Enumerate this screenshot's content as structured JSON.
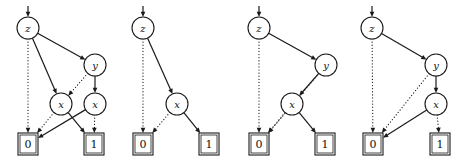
{
  "figure": {
    "kind": "bdd-diagram-row",
    "count": 4,
    "width": 467,
    "height": 164,
    "colors": {
      "background": "#ffffff",
      "stroke": "#1a1a1a",
      "label": "#111111"
    }
  },
  "labels": {
    "z": "z",
    "y": "y",
    "x": "x",
    "zero": "0",
    "one": "1"
  },
  "diagrams": [
    {
      "name": "diagram-1",
      "nodes": [
        {
          "id": "d1-z",
          "label": "z",
          "cx": 28,
          "cy": 28,
          "r": 11
        },
        {
          "id": "d1-y",
          "label": "y",
          "cx": 95,
          "cy": 65,
          "r": 11
        },
        {
          "id": "d1-x1",
          "label": "x",
          "cx": 61,
          "cy": 104,
          "r": 11
        },
        {
          "id": "d1-x2",
          "label": "x",
          "cx": 95,
          "cy": 104,
          "r": 11
        }
      ],
      "terminals": [
        {
          "id": "d1-t0",
          "label": "0",
          "cx": 28,
          "cy": 144,
          "w": 20,
          "h": 22
        },
        {
          "id": "d1-t1",
          "label": "1",
          "cx": 94,
          "cy": 144,
          "w": 20,
          "h": 22
        }
      ],
      "root_arrow": {
        "to": "d1-z"
      },
      "edges": [
        {
          "from": "d1-z",
          "to": "d1-t0",
          "style": "dotted"
        },
        {
          "from": "d1-z",
          "to": "d1-x1",
          "style": "solid"
        },
        {
          "from": "d1-z",
          "to": "d1-y",
          "style": "solid"
        },
        {
          "from": "d1-y",
          "to": "d1-x1",
          "style": "dotted"
        },
        {
          "from": "d1-y",
          "to": "d1-x2",
          "style": "solid"
        },
        {
          "from": "d1-x1",
          "to": "d1-t0",
          "style": "dotted"
        },
        {
          "from": "d1-x1",
          "to": "d1-t1",
          "style": "solid"
        },
        {
          "from": "d1-x2",
          "to": "d1-t0",
          "style": "solid"
        },
        {
          "from": "d1-x2",
          "to": "d1-t1",
          "style": "dotted"
        }
      ]
    },
    {
      "name": "diagram-2",
      "nodes": [
        {
          "id": "d2-z",
          "label": "z",
          "cx": 143,
          "cy": 28,
          "r": 11
        },
        {
          "id": "d2-x",
          "label": "x",
          "cx": 177,
          "cy": 104,
          "r": 11
        }
      ],
      "terminals": [
        {
          "id": "d2-t0",
          "label": "0",
          "cx": 143,
          "cy": 144,
          "w": 20,
          "h": 22
        },
        {
          "id": "d2-t1",
          "label": "1",
          "cx": 209,
          "cy": 144,
          "w": 20,
          "h": 22
        }
      ],
      "root_arrow": {
        "to": "d2-z"
      },
      "edges": [
        {
          "from": "d2-z",
          "to": "d2-t0",
          "style": "dotted"
        },
        {
          "from": "d2-z",
          "to": "d2-x",
          "style": "solid"
        },
        {
          "from": "d2-x",
          "to": "d2-t0",
          "style": "dotted"
        },
        {
          "from": "d2-x",
          "to": "d2-t1",
          "style": "solid"
        }
      ]
    },
    {
      "name": "diagram-3",
      "nodes": [
        {
          "id": "d3-z",
          "label": "z",
          "cx": 259,
          "cy": 28,
          "r": 11
        },
        {
          "id": "d3-y",
          "label": "y",
          "cx": 326,
          "cy": 65,
          "r": 11
        },
        {
          "id": "d3-x",
          "label": "x",
          "cx": 292,
          "cy": 104,
          "r": 11
        }
      ],
      "terminals": [
        {
          "id": "d3-t0",
          "label": "0",
          "cx": 259,
          "cy": 144,
          "w": 20,
          "h": 22
        },
        {
          "id": "d3-t1",
          "label": "1",
          "cx": 325,
          "cy": 144,
          "w": 20,
          "h": 22
        }
      ],
      "root_arrow": {
        "to": "d3-z"
      },
      "edges": [
        {
          "from": "d3-z",
          "to": "d3-t0",
          "style": "dotted"
        },
        {
          "from": "d3-z",
          "to": "d3-y",
          "style": "solid"
        },
        {
          "from": "d3-y",
          "to": "d3-t0",
          "style": "dotted"
        },
        {
          "from": "d3-y",
          "to": "d3-x",
          "style": "solid"
        },
        {
          "from": "d3-x",
          "to": "d3-t0",
          "style": "dotted"
        },
        {
          "from": "d3-x",
          "to": "d3-t1",
          "style": "solid"
        }
      ]
    },
    {
      "name": "diagram-4",
      "nodes": [
        {
          "id": "d4-z",
          "label": "z",
          "cx": 372,
          "cy": 28,
          "r": 11
        },
        {
          "id": "d4-y",
          "label": "y",
          "cx": 436,
          "cy": 65,
          "r": 11
        },
        {
          "id": "d4-x",
          "label": "x",
          "cx": 436,
          "cy": 104,
          "r": 11
        }
      ],
      "terminals": [
        {
          "id": "d4-t0",
          "label": "0",
          "cx": 373,
          "cy": 144,
          "w": 20,
          "h": 22
        },
        {
          "id": "d4-t1",
          "label": "1",
          "cx": 440,
          "cy": 144,
          "w": 20,
          "h": 22
        }
      ],
      "root_arrow": {
        "to": "d4-z"
      },
      "edges": [
        {
          "from": "d4-z",
          "to": "d4-t0",
          "style": "dotted"
        },
        {
          "from": "d4-z",
          "to": "d4-y",
          "style": "solid"
        },
        {
          "from": "d4-y",
          "to": "d4-t0",
          "style": "dotted"
        },
        {
          "from": "d4-y",
          "to": "d4-x",
          "style": "solid"
        },
        {
          "from": "d4-x",
          "to": "d4-t0",
          "style": "solid"
        },
        {
          "from": "d4-x",
          "to": "d4-t1",
          "style": "dotted"
        }
      ]
    }
  ]
}
